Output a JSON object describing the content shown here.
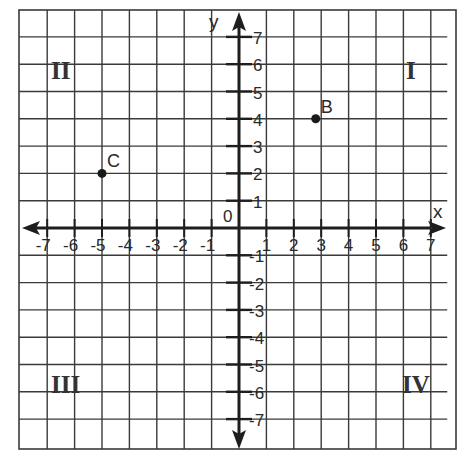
{
  "chart_data": {
    "type": "scatter",
    "title": "",
    "xlabel": "x",
    "ylabel": "y",
    "xlim": [
      -7,
      7
    ],
    "ylim": [
      -7,
      7
    ],
    "grid": true,
    "origin_label": "0",
    "x_ticks": [
      "-7",
      "-6",
      "-5",
      "-4",
      "-3",
      "-2",
      "-1",
      "1",
      "2",
      "3",
      "4",
      "5",
      "6",
      "7"
    ],
    "y_ticks": [
      "7",
      "6",
      "5",
      "4",
      "3",
      "2",
      "1",
      "-1",
      "-2",
      "-3",
      "-4",
      "-5",
      "-6",
      "-7"
    ],
    "quadrants": [
      {
        "label": "I",
        "position": "top-right"
      },
      {
        "label": "II",
        "position": "top-left"
      },
      {
        "label": "III",
        "position": "bottom-left"
      },
      {
        "label": "IV",
        "position": "bottom-right"
      }
    ],
    "points": [
      {
        "label": "B",
        "x": 2.8,
        "y": 4
      },
      {
        "label": "C",
        "x": -5,
        "y": 2
      }
    ]
  },
  "colors": {
    "grid": "#3a3a3a",
    "axis": "#1e1e1e",
    "text": "#2a2a2a"
  }
}
